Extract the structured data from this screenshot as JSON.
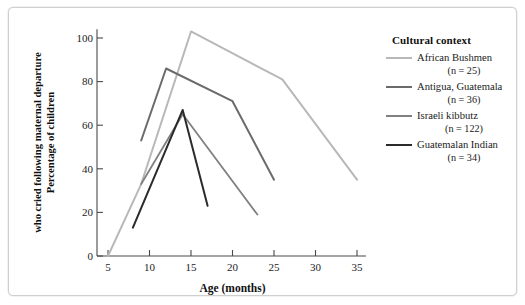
{
  "chart_data": {
    "type": "line",
    "title": "",
    "xlabel": "Age (months)",
    "ylabel_line1": "Percentage of children",
    "ylabel_line2": "who cried following maternal departure",
    "xlim": [
      3.5,
      36.5
    ],
    "ylim": [
      0,
      104
    ],
    "xticks": [
      5,
      10,
      15,
      20,
      25,
      30,
      35
    ],
    "xtick_labels": [
      "5",
      "10",
      "15",
      "20",
      "25",
      "30",
      "35"
    ],
    "yticks": [
      0,
      20,
      40,
      60,
      80,
      100
    ],
    "ytick_labels": [
      "0",
      "20",
      "40",
      "60",
      "80",
      "100"
    ],
    "grid": false,
    "legend_position": "right",
    "legend_title": "Cultural context",
    "series": [
      {
        "name": "African Bushmen",
        "n": 25,
        "n_label": "(n = 25)",
        "color": "#b8b8b8",
        "width": 2.0,
        "x": [
          5,
          9,
          15,
          26,
          35
        ],
        "y": [
          0,
          33,
          103,
          81,
          35
        ]
      },
      {
        "name": "Antigua, Guatemala",
        "n": 36,
        "n_label": "(n = 36)",
        "color": "#6b6b6b",
        "width": 2.0,
        "x": [
          9,
          12,
          20,
          25
        ],
        "y": [
          53,
          86,
          71,
          35
        ]
      },
      {
        "name": "Israeli kibbutz",
        "n": 122,
        "n_label": "(n = 122)",
        "color": "#808080",
        "width": 1.8,
        "x": [
          9,
          14,
          23
        ],
        "y": [
          33,
          65,
          19
        ]
      },
      {
        "name": "Guatemalan Indian",
        "n": 34,
        "n_label": "(n = 34)",
        "color": "#2b2b2b",
        "width": 2.0,
        "x": [
          8,
          14,
          17
        ],
        "y": [
          13,
          67,
          23
        ]
      }
    ]
  },
  "legend": {
    "title": "Cultural context",
    "items": [
      {
        "label": "African Bushmen",
        "n_label": "(n = 25)",
        "n_prefix": "(",
        "n_value": " = 25)"
      },
      {
        "label": "Antigua, Guatemala",
        "n_label": "(n = 36)",
        "n_prefix": "(",
        "n_value": " = 36)"
      },
      {
        "label": "Israeli kibbutz",
        "n_label": "(n = 122)",
        "n_prefix": "(",
        "n_value": " = 122)"
      },
      {
        "label": "Guatemalan Indian",
        "n_label": "(n = 34)",
        "n_prefix": "(",
        "n_value": " = 34)"
      }
    ]
  },
  "axes": {
    "x_title": "Age (months)",
    "y_title_line1": "Percentage of children",
    "y_title_line2": "who cried following maternal departure"
  }
}
